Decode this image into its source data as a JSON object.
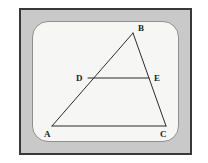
{
  "figure": {
    "frame": {
      "border_color": "#39393b",
      "matte_color": "#c9c9c9",
      "panel_color": "#f6f6f4",
      "panel_border_color": "#8f8f8f"
    },
    "stroke_color": "#2b2b2b",
    "label_color": "#1c1c1c",
    "vertices": [
      {
        "id": "A",
        "label": "A",
        "x": 52,
        "y": 126,
        "label_x": 44,
        "label_y": 130
      },
      {
        "id": "B",
        "label": "B",
        "x": 133,
        "y": 33,
        "label_x": 138,
        "label_y": 24
      },
      {
        "id": "C",
        "label": "C",
        "x": 166,
        "y": 126,
        "label_x": 160,
        "label_y": 130
      },
      {
        "id": "D",
        "label": "D",
        "x": 88,
        "y": 78,
        "label_x": 76,
        "label_y": 74
      },
      {
        "id": "E",
        "label": "E",
        "x": 149,
        "y": 78,
        "label_x": 154,
        "label_y": 74
      }
    ],
    "segments": [
      {
        "id": "AB",
        "from": "A",
        "to": "B"
      },
      {
        "id": "BC",
        "from": "B",
        "to": "C"
      },
      {
        "id": "AC",
        "from": "A",
        "to": "C"
      },
      {
        "id": "DE",
        "from": "D",
        "to": "E"
      }
    ]
  }
}
